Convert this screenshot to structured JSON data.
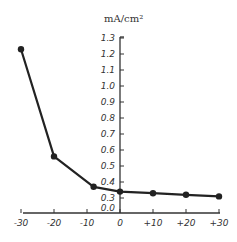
{
  "chart_data": {
    "type": "line",
    "title": "",
    "xlabel": "",
    "ylabel": "mA/cm²",
    "x": [
      -30,
      -20,
      -8,
      0,
      10,
      20,
      30
    ],
    "series": [
      {
        "name": "current density",
        "values": [
          1.23,
          0.56,
          0.37,
          0.34,
          0.33,
          0.32,
          0.31
        ]
      }
    ],
    "x_ticks": [
      "-30",
      "-20",
      "-10",
      "0",
      "+10",
      "+20",
      "+30"
    ],
    "x_tick_values": [
      -30,
      -20,
      -10,
      0,
      10,
      20,
      30
    ],
    "y_ticks": [
      "1.3",
      "1.2",
      "1.1",
      "1.0",
      "0.9",
      "0.8",
      "0.7",
      "0.6",
      "0.5",
      "0.4",
      "0.3",
      "0.0"
    ],
    "y_tick_values": [
      1.3,
      1.2,
      1.1,
      1.0,
      0.9,
      0.8,
      0.7,
      0.6,
      0.5,
      0.4,
      0.3,
      0.0
    ],
    "xlim": [
      -30,
      30
    ],
    "ylim": [
      0.0,
      1.3
    ],
    "y_axis_break": "between 0.0 and 0.3",
    "grid": false,
    "legend": "none",
    "colors": {
      "line": "#222222",
      "axis": "#333333"
    }
  }
}
